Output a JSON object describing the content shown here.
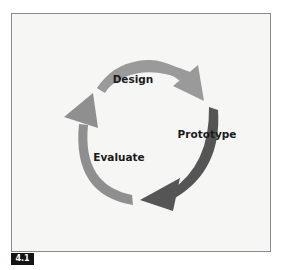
{
  "diagram": {
    "type": "cycle",
    "stages": [
      {
        "label": "Design",
        "color": "#9a9a9a"
      },
      {
        "label": "Prototype",
        "color": "#555555"
      },
      {
        "label": "Evaluate",
        "color": "#8f8f8f"
      }
    ],
    "background": "#f6f6f5",
    "border_color": "#8a8a8a"
  },
  "figure": {
    "label": "4.1"
  }
}
